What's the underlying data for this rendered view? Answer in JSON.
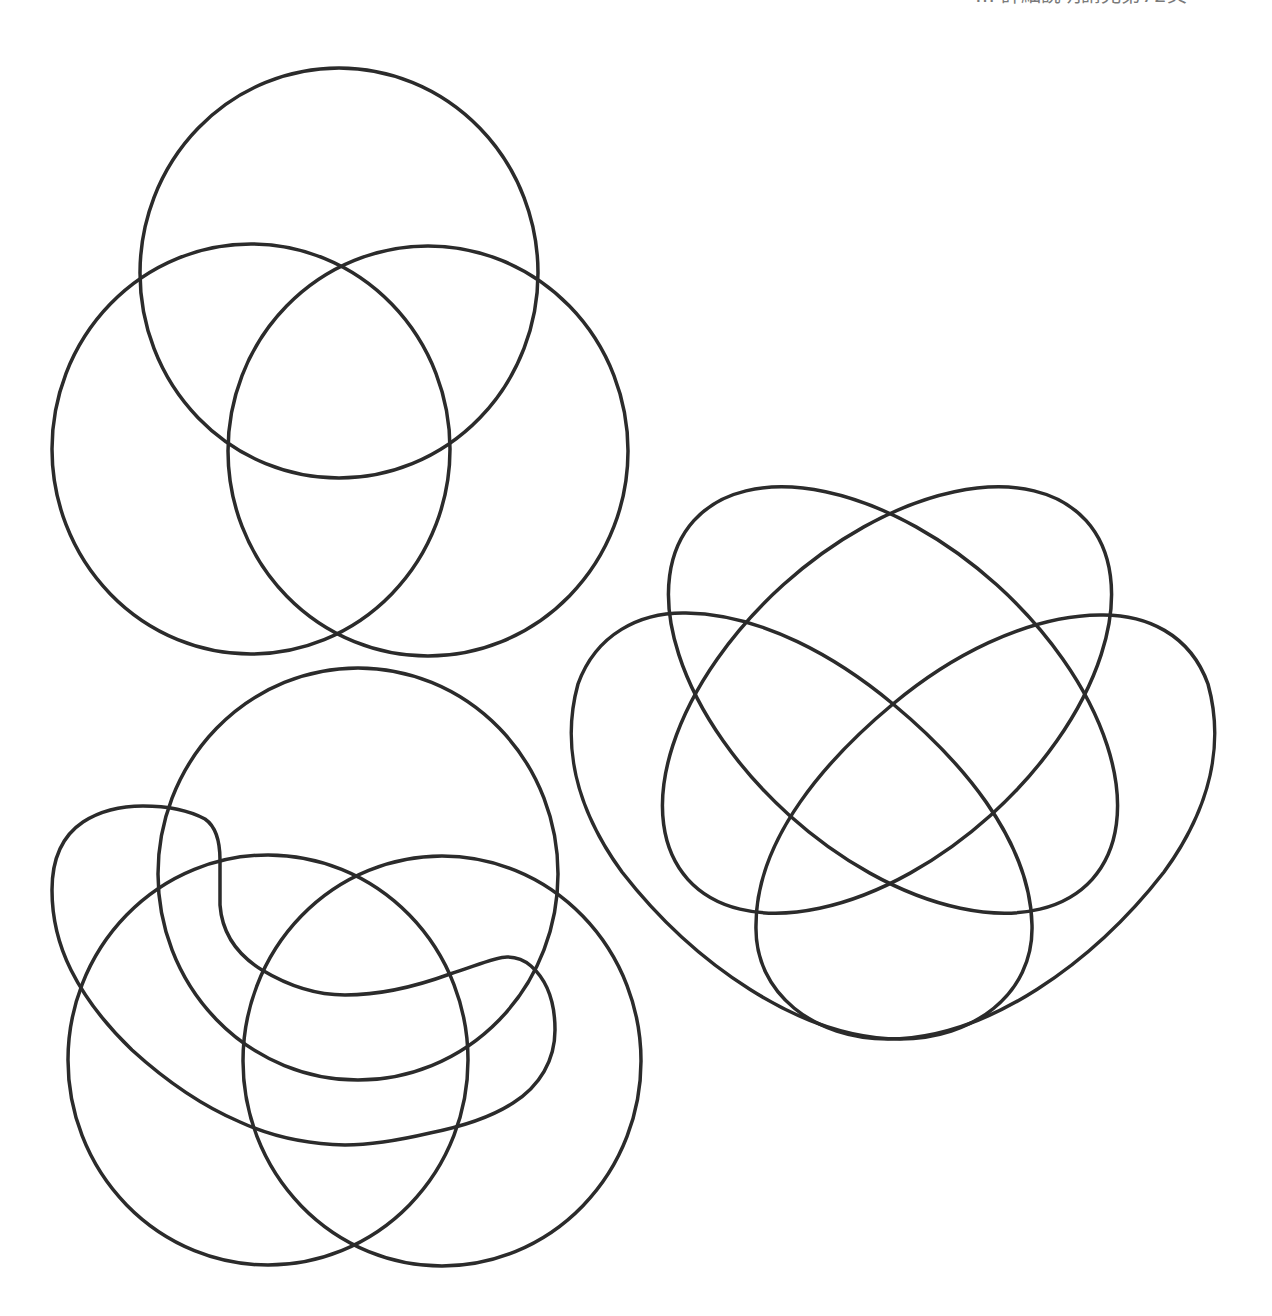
{
  "header": {
    "clipped_caption": "… 詳細說明請見第72頁"
  },
  "style": {
    "stroke_color": "#2b2b2b",
    "stroke_width": 3.5,
    "background": "#ffffff",
    "caption_color": "#7a7a7a"
  },
  "diagrams": [
    {
      "name": "three-set-venn",
      "sets": 3,
      "shapes": [
        {
          "type": "ellipse",
          "label": "top-circle",
          "cx": 339,
          "cy": 273,
          "rx": 199,
          "ry": 205
        },
        {
          "type": "ellipse",
          "label": "left-circle",
          "cx": 251,
          "cy": 449,
          "rx": 199,
          "ry": 205
        },
        {
          "type": "ellipse",
          "label": "right-circle",
          "cx": 428,
          "cy": 451,
          "rx": 200,
          "ry": 205
        }
      ]
    },
    {
      "name": "four-set-venn-with-wiggly-curve",
      "sets": 4,
      "shapes": [
        {
          "type": "ellipse",
          "label": "top-circle",
          "cx": 358,
          "cy": 874,
          "rx": 200,
          "ry": 206
        },
        {
          "type": "ellipse",
          "label": "left-circle",
          "cx": 268,
          "cy": 1060,
          "rx": 200,
          "ry": 205
        },
        {
          "type": "ellipse",
          "label": "right-circle",
          "cx": 442,
          "cy": 1061,
          "rx": 199,
          "ry": 205
        },
        {
          "type": "path",
          "label": "wiggly-curve",
          "d": "M 143,806 C 170,806 190,811 205,819 C 218,828 220,845 220,860 L 220,905 C 222,932 236,954 262,970 C 292,988 320,995 345,995 C 382,995 420,985 450,974 C 478,965 496,957 507,957 C 516,957 523,959 531,966 C 548,981 555,1005 555,1030 C 555,1060 540,1086 513,1103 C 490,1118 460,1127 430,1133 C 400,1140 372,1145 345,1145 C 300,1144 266,1134 240,1122 C 200,1105 165,1080 132,1050 C 106,1025 86,1000 71,970 C 58,944 52,916 52,890 C 52,860 62,836 83,822 C 100,811 120,806 143,806 Z"
        }
      ]
    },
    {
      "name": "four-set-ellipse-venn",
      "sets": 4,
      "shapes": [
        {
          "type": "ellipse",
          "label": "nw-se-ellipse",
          "cx": 893,
          "cy": 700,
          "rx": 268,
          "ry": 155,
          "rotate": 42
        },
        {
          "type": "ellipse",
          "label": "ne-sw-ellipse",
          "cx": 887,
          "cy": 700,
          "rx": 268,
          "ry": 155,
          "rotate": -42
        },
        {
          "type": "path",
          "label": "left-teardrop",
          "d": "M 686,613 C 762,614 838,658 893,704 C 958,758 1030,838 1032,925 C 1034,995 972,1039 900,1039 C 800,1039 692,962 622,872 C 574,806 562,742 578,684 C 596,634 640,612 686,613 Z"
        },
        {
          "type": "path",
          "label": "right-teardrop",
          "d": "M 1100,615 C 1024,616 948,658 893,704 C 828,758 756,838 756,925 C 754,995 816,1039 888,1039 C 988,1039 1094,962 1164,872 C 1212,806 1224,742 1208,684 C 1190,634 1146,614 1100,615 Z"
        }
      ]
    }
  ]
}
